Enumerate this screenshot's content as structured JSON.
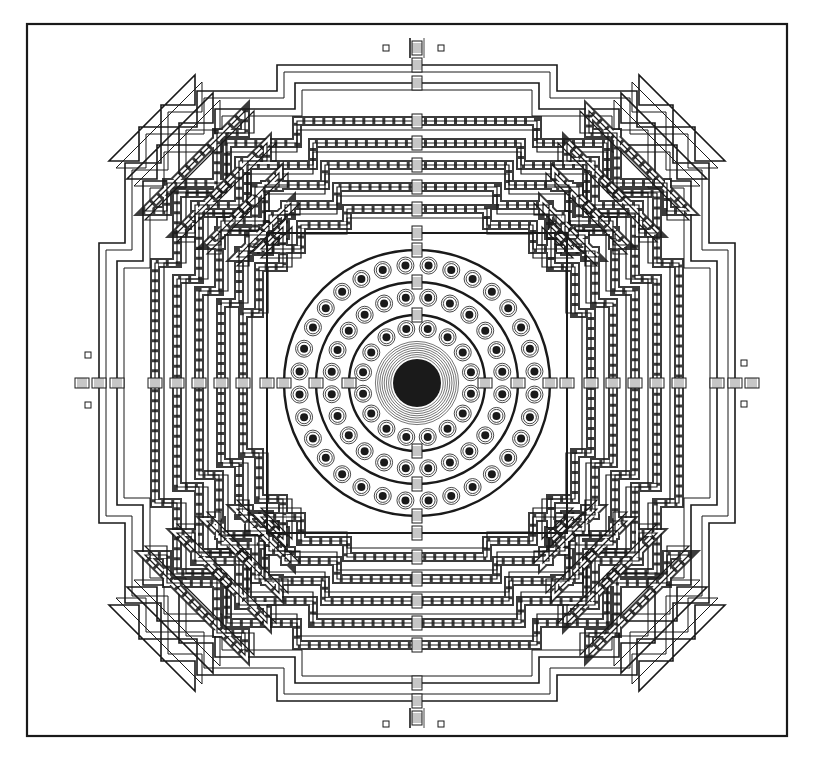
{
  "figure": {
    "width": 818,
    "height": 780,
    "background": "#ffffff",
    "ink": "#1a1a1a",
    "frame": {
      "x": 18,
      "y": 23,
      "w": 491,
      "h": 715,
      "x2": 508,
      "note": "outer border rectangle"
    },
    "center": {
      "x": 417,
      "y": 383
    }
  },
  "outer_terraces": [
    {
      "half": 318,
      "steps": [
        [
          318,
          160
        ],
        [
          285,
          160
        ],
        [
          285,
          230
        ],
        [
          196,
          230
        ],
        [
          196,
          290
        ],
        [
          318,
          290
        ]
      ]
    },
    {
      "half": 305,
      "steps": []
    }
  ],
  "square_terraces": [
    {
      "name": "outer-foundation-outline-1",
      "half_outer": 318,
      "inset_steps": [
        0,
        33,
        122
      ],
      "step_len": [
        158,
        70,
        58
      ],
      "gallery": false,
      "double": true
    },
    {
      "name": "outer-foundation-outline-2",
      "half_outer": 300,
      "inset_steps": [
        0,
        33,
        122
      ],
      "step_len": [
        150,
        66,
        54
      ],
      "gallery": false,
      "double": true
    },
    {
      "name": "gallery-1",
      "half_outer": 262,
      "inset_steps": [
        0,
        22,
        68,
        96
      ],
      "step_len": [
        178,
        44,
        64
      ],
      "gallery": true
    },
    {
      "name": "gallery-2",
      "half_outer": 244,
      "inset_steps": [
        0,
        22,
        68,
        96
      ],
      "step_len": [
        160,
        44,
        56
      ],
      "gallery": true
    },
    {
      "name": "gallery-3",
      "half_outer": 222,
      "inset_steps": [
        0,
        20,
        60,
        84
      ],
      "step_len": [
        142,
        40,
        50
      ],
      "gallery": true
    },
    {
      "name": "gallery-4",
      "half_outer": 200,
      "inset_steps": [
        0,
        20,
        56,
        76
      ],
      "step_len": [
        126,
        36,
        44
      ],
      "gallery": true
    },
    {
      "name": "gallery-5",
      "half_outer": 176,
      "inset_steps": [
        0,
        18,
        48
      ],
      "step_len": [
        112,
        30,
        40
      ],
      "gallery": true
    },
    {
      "name": "inner-terrace",
      "half_outer": 150,
      "inset_steps": [
        0,
        14
      ],
      "step_len": [
        140,
        0
      ],
      "gallery": false,
      "double": false
    }
  ],
  "circular_terraces": [
    {
      "name": "round-terrace-outer",
      "radius": 133,
      "stupa_count": 32,
      "stupa_ring_radius": 118
    },
    {
      "name": "round-terrace-middle",
      "radius": 101,
      "stupa_count": 24,
      "stupa_ring_radius": 86
    },
    {
      "name": "round-terrace-inner",
      "radius": 68,
      "stupa_count": 16,
      "stupa_ring_radius": 55
    }
  ],
  "main_stupa": {
    "radius": 24,
    "rings": 8,
    "ring_spacing": 2.2
  },
  "stairways": [
    "north",
    "south",
    "east",
    "west"
  ],
  "gate_markers": [
    {
      "x": 386,
      "y": 48
    },
    {
      "x": 441,
      "y": 48
    },
    {
      "x": 386,
      "y": 724
    },
    {
      "x": 441,
      "y": 724
    },
    {
      "x": 88,
      "y": 355
    },
    {
      "x": 88,
      "y": 405
    },
    {
      "x": 744,
      "y": 363
    },
    {
      "x": 744,
      "y": 404
    }
  ]
}
